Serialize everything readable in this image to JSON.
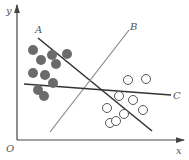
{
  "diagram": {
    "type": "linear-classifier-separating-lines",
    "axes": {
      "x_label": "x",
      "y_label": "y",
      "origin_label": "O",
      "color": "#444444"
    },
    "lines": [
      {
        "label": "A",
        "x1": 38,
        "y1": 38,
        "x2": 152,
        "y2": 131,
        "color": "#333333",
        "width": 1.6
      },
      {
        "label": "B",
        "x1": 50,
        "y1": 132,
        "x2": 129,
        "y2": 30,
        "color": "#888888",
        "width": 1.2
      },
      {
        "label": "C",
        "x1": 24,
        "y1": 84,
        "x2": 171,
        "y2": 95,
        "color": "#333333",
        "width": 1.6
      }
    ],
    "filled_class": {
      "fill": "#6b6b6b",
      "points": [
        [
          33,
          50
        ],
        [
          41,
          60
        ],
        [
          52,
          55
        ],
        [
          67,
          54
        ],
        [
          56,
          64
        ],
        [
          33,
          73
        ],
        [
          45,
          75
        ],
        [
          53,
          83
        ],
        [
          38,
          90
        ],
        [
          44,
          96
        ]
      ]
    },
    "open_class": {
      "stroke": "#555555",
      "points": [
        [
          128,
          80
        ],
        [
          146,
          79
        ],
        [
          119,
          96
        ],
        [
          133,
          100
        ],
        [
          107,
          108
        ],
        [
          124,
          114
        ],
        [
          143,
          110
        ],
        [
          110,
          123
        ],
        [
          116,
          121
        ]
      ]
    }
  }
}
